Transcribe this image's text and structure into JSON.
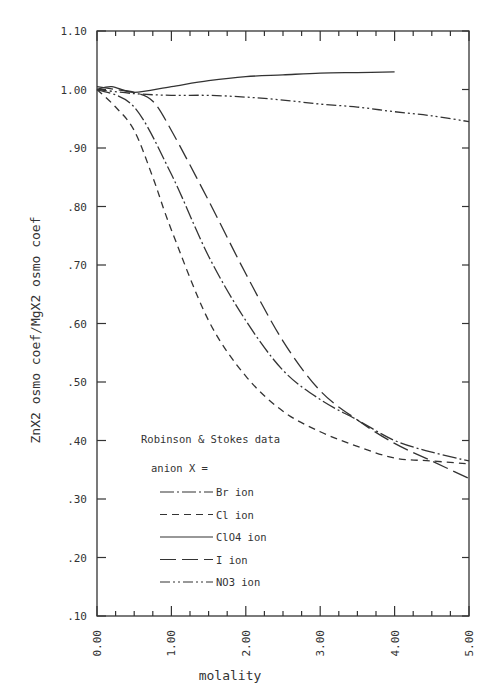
{
  "chart_data": {
    "type": "line",
    "title": "",
    "xlabel": "molality",
    "ylabel": "ZnX2 osmo coef/MgX2 osmo coef",
    "xlim": [
      0,
      5
    ],
    "ylim": [
      0.1,
      1.1
    ],
    "xticks": [
      "0.00",
      "1.00",
      "2.00",
      "3.00",
      "4.00",
      "5.00"
    ],
    "yticks": [
      ".10",
      ".20",
      ".30",
      ".40",
      ".50",
      ".60",
      ".70",
      ".80",
      ".90",
      "1.00",
      "1.10"
    ],
    "grid": false,
    "annotation": "Robinson & Stokes data",
    "legend_title": "anion X =",
    "legend_position": "lower-left inside",
    "series": [
      {
        "name": "Br ion",
        "style": "dash-dot",
        "x": [
          0,
          0.5,
          1.0,
          1.5,
          2.0,
          2.5,
          3.0,
          3.5,
          4.0,
          4.5,
          5.0
        ],
        "values": [
          1.0,
          0.97,
          0.855,
          0.715,
          0.605,
          0.52,
          0.47,
          0.435,
          0.4,
          0.38,
          0.365
        ]
      },
      {
        "name": "Cl ion",
        "style": "short-dash",
        "x": [
          0,
          0.25,
          0.5,
          0.75,
          1.0,
          1.5,
          2.0,
          2.5,
          3.0,
          3.5,
          4.0,
          4.5,
          5.0
        ],
        "values": [
          1.0,
          0.97,
          0.93,
          0.85,
          0.76,
          0.605,
          0.51,
          0.45,
          0.415,
          0.39,
          0.37,
          0.365,
          0.36
        ]
      },
      {
        "name": "ClO4 ion",
        "style": "solid",
        "x": [
          0,
          0.2,
          0.5,
          1.0,
          1.5,
          2.0,
          2.5,
          3.0,
          3.5,
          4.0
        ],
        "values": [
          1.0,
          1.005,
          0.995,
          1.005,
          1.015,
          1.022,
          1.025,
          1.028,
          1.029,
          1.03
        ]
      },
      {
        "name": "I ion",
        "style": "long-dash",
        "x": [
          0,
          0.25,
          0.5,
          0.75,
          1.0,
          1.5,
          2.0,
          2.5,
          3.0,
          3.5,
          4.0,
          4.5,
          5.0
        ],
        "values": [
          1.005,
          1.0,
          0.995,
          0.98,
          0.93,
          0.81,
          0.685,
          0.57,
          0.485,
          0.435,
          0.395,
          0.365,
          0.335
        ]
      },
      {
        "name": "NO3 ion",
        "style": "dash-dot-dot",
        "x": [
          0,
          0.5,
          1.0,
          1.5,
          2.0,
          2.5,
          3.0,
          3.5,
          4.0,
          4.5,
          5.0
        ],
        "values": [
          1.0,
          0.993,
          0.99,
          0.99,
          0.987,
          0.982,
          0.975,
          0.97,
          0.962,
          0.955,
          0.945
        ]
      }
    ]
  }
}
